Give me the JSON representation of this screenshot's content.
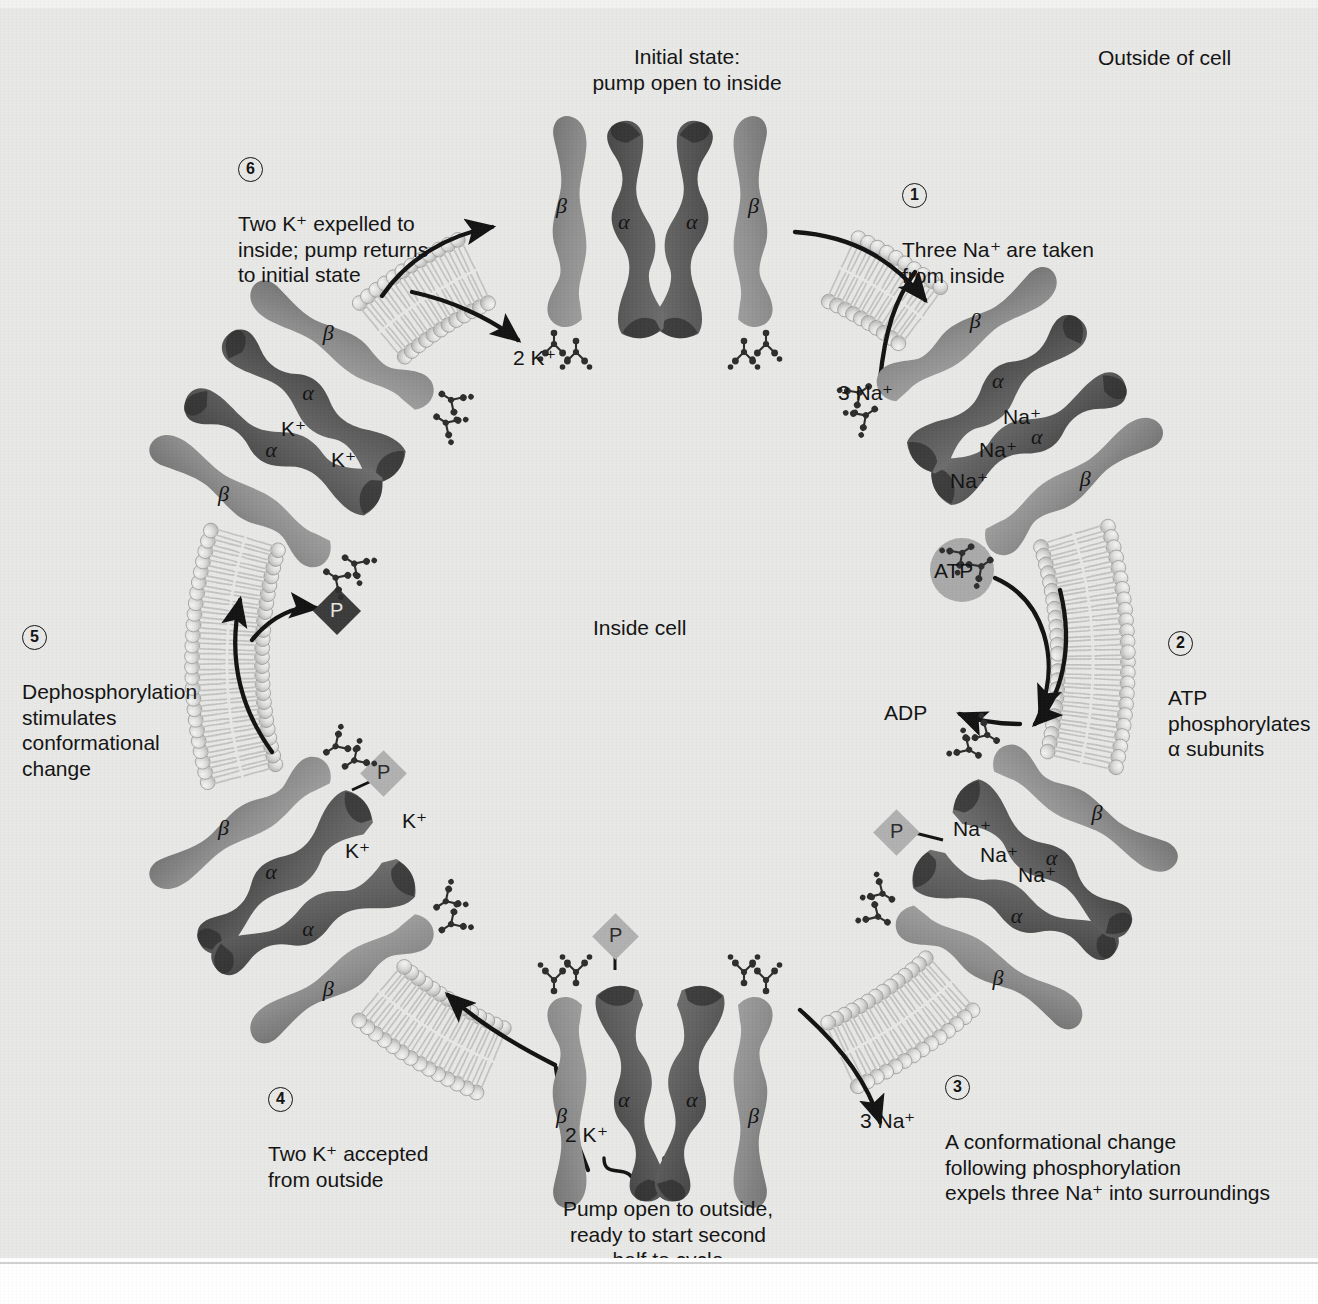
{
  "figure": {
    "inside_label": "Inside cell",
    "outside_label": "Outside of cell",
    "initial_state": "Initial state:\npump open to inside",
    "bottom_state": "Pump open to outside,\nready to start second\nhalf to cycle"
  },
  "steps": [
    {
      "num": "1",
      "text": "Three Na⁺ are taken\nfrom inside"
    },
    {
      "num": "2",
      "text": "ATP\nphosphorylates\nα subunits"
    },
    {
      "num": "3",
      "text": "A conformational change\nfollowing phosphorylation\nexpels three Na⁺ into surroundings"
    },
    {
      "num": "4",
      "text": "Two K⁺ accepted\nfrom outside"
    },
    {
      "num": "5",
      "text": "Dephosphorylation\nstimulates\nconformational\nchange"
    },
    {
      "num": "6",
      "text": "Two K⁺ expelled to\ninside; pump returns\nto initial state"
    }
  ],
  "flux_labels": {
    "na_in": "3 Na⁺",
    "na_out": "3 Na⁺",
    "k_in": "2 K⁺",
    "k_out": "2 K⁺"
  },
  "molecules": {
    "atp": "ATP",
    "adp": "ADP",
    "phosphate": "P"
  },
  "subunits": {
    "alpha": "α",
    "beta": "β"
  },
  "ions": {
    "sodium": "Na⁺",
    "potassium": "K⁺"
  },
  "complexes": [
    {
      "name": "top-pump",
      "state": "open-to-inside",
      "bound_ions": [],
      "phosphorylated": false
    },
    {
      "name": "upper-right-pump",
      "state": "sodium-loaded",
      "bound_ions": [
        "Na⁺",
        "Na⁺",
        "Na⁺"
      ],
      "phosphorylated": false
    },
    {
      "name": "lower-right-pump",
      "state": "sodium-loaded-phosphorylated",
      "bound_ions": [
        "Na⁺",
        "Na⁺",
        "Na⁺"
      ],
      "phosphorylated": true
    },
    {
      "name": "bottom-pump",
      "state": "open-to-outside-phosphorylated",
      "bound_ions": [],
      "phosphorylated": true
    },
    {
      "name": "lower-left-pump",
      "state": "potassium-loaded-phosphorylated",
      "bound_ions": [
        "K⁺",
        "K⁺"
      ],
      "phosphorylated": true
    },
    {
      "name": "upper-left-pump",
      "state": "potassium-loaded",
      "bound_ions": [
        "K⁺",
        "K⁺"
      ],
      "phosphorylated": false
    }
  ],
  "colors": {
    "background": "#e8e8e6",
    "alpha_subunit": "#5e5e5e",
    "beta_subunit": "#8f8f8f",
    "membrane_head": "#d8d8d6",
    "membrane_tail": "#c6c6c4",
    "arrow": "#111111",
    "atp_circle": "#a9a9a9",
    "phosphate_free": "#3a3a3a",
    "phosphate_bound": "#b0b0b0",
    "text": "#111111"
  }
}
